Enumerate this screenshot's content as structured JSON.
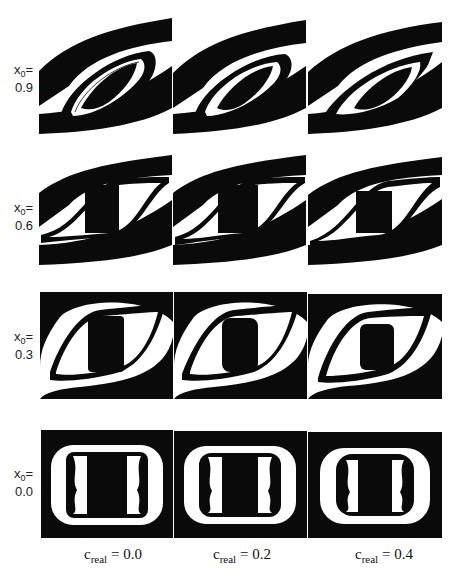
{
  "figure": {
    "rows": [
      {
        "var": "x",
        "sub": "0",
        "eq": "=",
        "value": "0.9",
        "shape": "sheared-strong"
      },
      {
        "var": "x",
        "sub": "0",
        "eq": "=",
        "value": "0.6",
        "shape": "sheared-medium"
      },
      {
        "var": "x",
        "sub": "0",
        "eq": "=",
        "value": "0.3",
        "shape": "sheared-weak"
      },
      {
        "var": "x",
        "sub": "0",
        "eq": "=",
        "value": "0.0",
        "shape": "square"
      }
    ],
    "columns": [
      {
        "var": "c",
        "sub": "real",
        "eq": " = ",
        "value": "0.0"
      },
      {
        "var": "c",
        "sub": "real",
        "eq": " = ",
        "value": "0.2"
      },
      {
        "var": "c",
        "sub": "real",
        "eq": " = ",
        "value": "0.4"
      }
    ],
    "colors": {
      "fill": "#0a0a0a",
      "background": "#ffffff"
    }
  }
}
